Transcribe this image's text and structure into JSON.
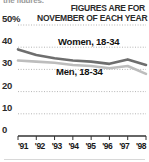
{
  "figure": {
    "truncated_lead_text": "the figures.",
    "kicker_line1": "FIGURES ARE FOR",
    "kicker_line2": "NOVEMBER OF EACH YEAR"
  },
  "colors": {
    "women_line": "#6e6e6e",
    "men_line": "#bdbdbd",
    "gridline": "#b4b4b4",
    "axis": "#333333",
    "text": "#1a1a1a",
    "kicker_text": "#2b2b2b",
    "background": "#ffffff"
  },
  "axis": {
    "y_ticks": [
      "50%",
      "40",
      "30",
      "20",
      "10",
      "0"
    ],
    "x_ticks": [
      "'91",
      "'92",
      "'93",
      "'94",
      "'95",
      "'96",
      "'97",
      "'98"
    ]
  },
  "chart_data": {
    "type": "line",
    "title": "",
    "subtitle": "FIGURES ARE FOR NOVEMBER OF EACH YEAR",
    "xlabel": "",
    "ylabel": "",
    "ylim": [
      0,
      50
    ],
    "grid": true,
    "legend_position": "inline-labels",
    "categories": [
      "'91",
      "'92",
      "'93",
      "'94",
      "'95",
      "'96",
      "'97",
      "'98"
    ],
    "series": [
      {
        "name": "Women, 18-34",
        "color": "#6e6e6e",
        "values": [
          39,
          36.5,
          35,
          34,
          33.5,
          32.5,
          34.5,
          32
        ]
      },
      {
        "name": "Men, 18-34",
        "color": "#bdbdbd",
        "values": [
          34,
          33.5,
          33,
          32,
          31.5,
          30.5,
          31.5,
          28
        ]
      }
    ]
  }
}
